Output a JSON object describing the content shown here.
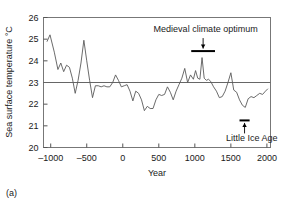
{
  "figure": {
    "panel_label": "(a)"
  },
  "chart_data": {
    "type": "line",
    "title": "",
    "xlabel": "Year",
    "ylabel": "Sea surface temperature °C",
    "xlim": [
      -1100,
      2050
    ],
    "ylim": [
      20,
      26
    ],
    "xticks": [
      -1000,
      -500,
      0,
      500,
      1000,
      1500,
      2000
    ],
    "xticklabels": [
      "–1000",
      "–500",
      "0",
      "500",
      "1000",
      "1500",
      "2000"
    ],
    "yticks": [
      20,
      21,
      22,
      23,
      24,
      25,
      26
    ],
    "yticklabels": [
      "20",
      "21",
      "22",
      "23",
      "24",
      "25",
      "26"
    ],
    "grid": false,
    "reference_line": {
      "value": 23,
      "orientation": "horizontal",
      "color": "#666666"
    },
    "line_color": "#5a5a5a",
    "series": [
      {
        "name": "Sea surface temperature",
        "x": [
          -1050,
          -1010,
          -950,
          -900,
          -860,
          -820,
          -780,
          -740,
          -700,
          -660,
          -620,
          -580,
          -540,
          -500,
          -460,
          -420,
          -380,
          -340,
          -300,
          -260,
          -220,
          -180,
          -140,
          -100,
          -60,
          -20,
          20,
          60,
          100,
          140,
          180,
          220,
          260,
          300,
          340,
          380,
          420,
          460,
          500,
          540,
          580,
          620,
          660,
          700,
          740,
          780,
          820,
          860,
          900,
          940,
          980,
          1010,
          1040,
          1070,
          1100,
          1130,
          1160,
          1190,
          1220,
          1260,
          1300,
          1340,
          1380,
          1420,
          1460,
          1500,
          1540,
          1580,
          1620,
          1660,
          1700,
          1740,
          1780,
          1820,
          1860,
          1900,
          1940,
          1980,
          2010
        ],
        "y": [
          24.9,
          25.2,
          24.4,
          23.6,
          23.9,
          23.5,
          23.8,
          23.7,
          23.2,
          22.5,
          23.1,
          23.9,
          24.95,
          24.0,
          23.1,
          22.3,
          22.85,
          22.85,
          22.8,
          22.85,
          22.8,
          22.8,
          23.0,
          23.35,
          23.1,
          22.8,
          22.85,
          22.9,
          22.6,
          22.15,
          22.6,
          22.5,
          22.2,
          21.7,
          21.9,
          21.8,
          21.8,
          22.2,
          22.45,
          22.4,
          22.45,
          22.8,
          22.55,
          22.2,
          22.6,
          22.9,
          23.2,
          23.65,
          23.0,
          23.35,
          23.15,
          23.55,
          23.2,
          23.15,
          24.15,
          23.2,
          23.1,
          23.15,
          23.05,
          22.8,
          22.6,
          22.3,
          22.35,
          22.6,
          23.0,
          23.45,
          22.65,
          22.55,
          22.2,
          21.95,
          21.85,
          22.25,
          22.35,
          22.3,
          22.4,
          22.5,
          22.45,
          22.6,
          22.7
        ]
      }
    ],
    "annotations": [
      {
        "id": "medieval-climate-optimum",
        "text": "Medieval climate optimum",
        "arrow_direction": "down",
        "bar_x_start": 950,
        "bar_x_end": 1280,
        "bar_y": 24.45,
        "text_x": 1150,
        "text_y": 25.5
      },
      {
        "id": "little-ice-age",
        "text": "Little Ice Age",
        "arrow_direction": "up",
        "bar_x_start": 1620,
        "bar_x_end": 1760,
        "bar_y": 21.25,
        "text_x": 1790,
        "text_y": 20.45
      }
    ]
  }
}
